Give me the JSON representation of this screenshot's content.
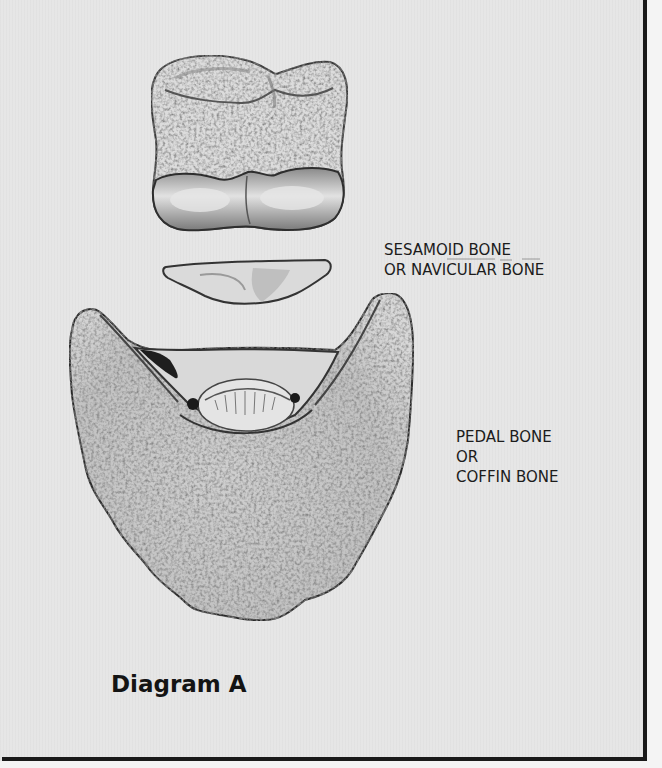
{
  "figure": {
    "title": "Diagram A",
    "labels": {
      "sesamoid": [
        "SESAMOID BONE",
        "OR NAVICULAR BONE"
      ],
      "pedal": [
        "PEDAL BONE",
        "OR",
        "COFFIN BONE"
      ]
    },
    "parts": [
      {
        "name": "short-pastern-bone",
        "description": "upper bone (square, unlabeled)"
      },
      {
        "name": "sesamoid-bone",
        "description": "small elongated bone, labeled SESAMOID BONE OR NAVICULAR BONE"
      },
      {
        "name": "pedal-bone",
        "description": "large crescent-shaped bone, labeled PEDAL BONE OR COFFIN BONE"
      }
    ],
    "colors": {
      "background": "#e6e6e6",
      "frame": "#1a1a1a",
      "text": "#1c1c1c",
      "bone_fill": "#d6d6d6",
      "bone_outline": "#3a3a3a"
    }
  }
}
